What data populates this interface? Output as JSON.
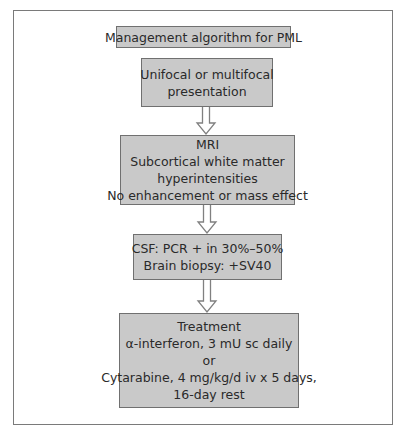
{
  "diagram": {
    "type": "flowchart",
    "title": "Management algorithm for PML",
    "nodes": [
      {
        "id": "presentation",
        "lines": [
          "Unifocal or multifocal",
          "presentation"
        ]
      },
      {
        "id": "mri",
        "lines": [
          "MRI",
          "Subcortical white matter",
          "hyperintensities",
          "No enhancement or mass effect"
        ]
      },
      {
        "id": "csf",
        "lines": [
          "CSF:  PCR + in 30%–50%",
          "Brain biopsy:  +SV40"
        ]
      },
      {
        "id": "treatment",
        "lines": [
          "Treatment",
          "α-interferon, 3 mU sc daily",
          "or",
          "Cytarabine, 4 mg/kg/d iv x 5 days,",
          "16-day rest"
        ]
      }
    ],
    "edges": [
      {
        "from": "presentation",
        "to": "mri"
      },
      {
        "from": "mri",
        "to": "csf"
      },
      {
        "from": "csf",
        "to": "treatment"
      }
    ],
    "colors": {
      "box_fill": "#c9c9c9",
      "box_border": "#707070",
      "arrow_stroke": "#808080",
      "frame": "#7a7a7a"
    }
  }
}
